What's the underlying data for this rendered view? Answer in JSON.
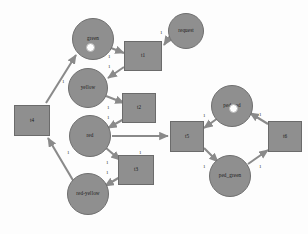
{
  "diagram": {
    "type": "petri-net",
    "background": "#fdfdfd",
    "node_fill": "#8f8f8f",
    "node_stroke": "#6b6b6b",
    "token_fill": "#ffffff",
    "arc_color": "#8a8a8a"
  },
  "places": [
    {
      "id": "green",
      "label": "green",
      "cx": 93,
      "cy": 39,
      "r": 21,
      "tokens": 1
    },
    {
      "id": "request",
      "label": "request",
      "cx": 186,
      "cy": 31,
      "r": 18,
      "tokens": 0
    },
    {
      "id": "yellow",
      "label": "yellow",
      "cx": 88,
      "cy": 88,
      "r": 20,
      "tokens": 0
    },
    {
      "id": "red",
      "label": "red",
      "cx": 90,
      "cy": 136,
      "r": 21,
      "tokens": 0
    },
    {
      "id": "red-yellow",
      "label": "red-yellow",
      "cx": 88,
      "cy": 194,
      "r": 21,
      "tokens": 0
    },
    {
      "id": "ped_red",
      "label": "ped_red",
      "cx": 232,
      "cy": 106,
      "r": 21,
      "tokens": 1
    },
    {
      "id": "ped_green",
      "label": "ped_green",
      "cx": 230,
      "cy": 176,
      "r": 21,
      "tokens": 0
    }
  ],
  "transitions": [
    {
      "id": "t1",
      "label": "t1",
      "x": 124,
      "y": 41,
      "w": 38,
      "h": 30
    },
    {
      "id": "t2",
      "label": "t2",
      "x": 122,
      "y": 93,
      "w": 34,
      "h": 30
    },
    {
      "id": "t3",
      "label": "t3",
      "x": 118,
      "y": 155,
      "w": 36,
      "h": 30
    },
    {
      "id": "t4",
      "label": "t4",
      "x": 14,
      "y": 105,
      "w": 36,
      "h": 31
    },
    {
      "id": "t5",
      "label": "t5",
      "x": 170,
      "y": 121,
      "w": 34,
      "h": 31
    },
    {
      "id": "t6",
      "label": "t6",
      "x": 268,
      "y": 121,
      "w": 34,
      "h": 31
    }
  ],
  "arcs": [
    {
      "from": "request",
      "to": "t1",
      "weight": "1"
    },
    {
      "from": "green",
      "to": "t1",
      "weight": "1"
    },
    {
      "from": "t1",
      "to": "yellow",
      "weight": "1"
    },
    {
      "from": "yellow",
      "to": "t2",
      "weight": "1"
    },
    {
      "from": "t2",
      "to": "red",
      "weight": "1"
    },
    {
      "from": "red",
      "to": "t3",
      "weight": "1"
    },
    {
      "from": "t3",
      "to": "red-yellow",
      "weight": "1"
    },
    {
      "from": "red-yellow",
      "to": "t4",
      "weight": "1"
    },
    {
      "from": "t4",
      "to": "green",
      "weight": "1"
    },
    {
      "from": "red",
      "to": "t5",
      "weight": "1"
    },
    {
      "from": "ped_red",
      "to": "t5",
      "weight": "1"
    },
    {
      "from": "t5",
      "to": "ped_green",
      "weight": "1"
    },
    {
      "from": "ped_green",
      "to": "t6",
      "weight": "1"
    },
    {
      "from": "t6",
      "to": "ped_red",
      "weight": "1"
    }
  ],
  "arc_labels": [
    {
      "id": "w-request-t1",
      "text": "1",
      "x": 160,
      "y": 30
    },
    {
      "id": "w-green-t1",
      "text": "1",
      "x": 108,
      "y": 54
    },
    {
      "id": "w-t1-yellow",
      "text": "1",
      "x": 108,
      "y": 64
    },
    {
      "id": "w-yellow-t2",
      "text": "1",
      "x": 107,
      "y": 105
    },
    {
      "id": "w-t2-red",
      "text": "1",
      "x": 107,
      "y": 115
    },
    {
      "id": "w-t4-green",
      "text": "1",
      "x": 62,
      "y": 79
    },
    {
      "id": "w-red-t5",
      "text": "1",
      "x": 139,
      "y": 150
    },
    {
      "id": "w-red-t3",
      "text": "1",
      "x": 106,
      "y": 160
    },
    {
      "id": "w-t3-redyellow",
      "text": "1",
      "x": 106,
      "y": 170
    },
    {
      "id": "w-redyellow-t4",
      "text": "1",
      "x": 67,
      "y": 150
    },
    {
      "id": "w-pedred-t5",
      "text": "1",
      "x": 203,
      "y": 113
    },
    {
      "id": "w-t6-pedred",
      "text": "1",
      "x": 259,
      "y": 112
    },
    {
      "id": "w-t5-pedgreen",
      "text": "1",
      "x": 203,
      "y": 164
    },
    {
      "id": "w-pedgreen-t6",
      "text": "1",
      "x": 259,
      "y": 164
    }
  ]
}
